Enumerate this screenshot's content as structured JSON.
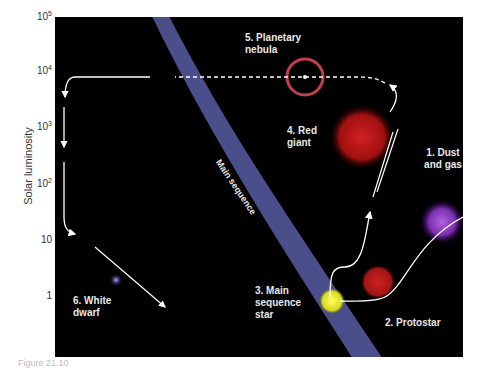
{
  "axis": {
    "ylabel": "Solar luminosity",
    "ticks": [
      {
        "base": "10",
        "exp": "5",
        "y": 17
      },
      {
        "base": "10",
        "exp": "4",
        "y": 71
      },
      {
        "base": "10",
        "exp": "3",
        "y": 127
      },
      {
        "base": "10",
        "exp": "2",
        "y": 184
      },
      {
        "base": "10",
        "exp": "",
        "y": 241
      },
      {
        "base": "1",
        "exp": "",
        "y": 297
      }
    ]
  },
  "labels": {
    "dust": "1. Dust and gas",
    "protostar": "2. Protostar",
    "main_seq_star": "3. Main sequence star",
    "red_giant": "4. Red giant",
    "nebula": "5. Planetary nebula",
    "white_dwarf": "6. White dwarf",
    "main_sequence_band": "Main sequence"
  },
  "caption": "Figure 21.10"
}
